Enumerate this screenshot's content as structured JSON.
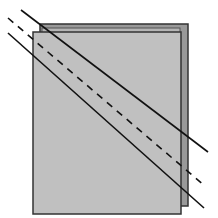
{
  "diagram": {
    "colors": {
      "back_square_fill": "#999999",
      "back_square_inner_fill": "#bdbdbd",
      "front_square_fill": "#c0c0c0",
      "border": "#333333",
      "line": "#111111",
      "background": "#ffffff"
    },
    "shapes": [
      {
        "name": "back-square",
        "style": "filled"
      },
      {
        "name": "front-square",
        "style": "filled"
      }
    ],
    "lines": [
      {
        "name": "upper-solid-line",
        "style": "solid"
      },
      {
        "name": "middle-dashed-line",
        "style": "dashed"
      },
      {
        "name": "lower-solid-line",
        "style": "solid"
      }
    ]
  }
}
